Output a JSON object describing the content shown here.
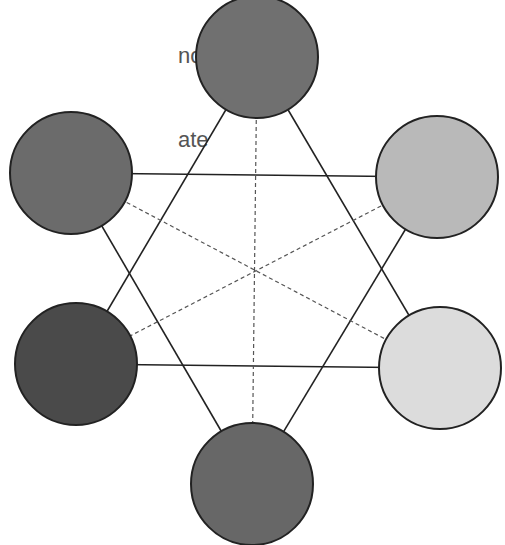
{
  "caption": {
    "line1": "                              notice",
    "line2": "ate",
    "line3": "i"
  },
  "diagram": {
    "nodes": [
      {
        "id": "top",
        "cx": 257,
        "cy": 57,
        "r": 61,
        "fill": "#707070"
      },
      {
        "id": "upper-right",
        "cx": 437,
        "cy": 177,
        "r": 61,
        "fill": "#b9b9b9"
      },
      {
        "id": "lower-right",
        "cx": 440,
        "cy": 368,
        "r": 61,
        "fill": "#dcdcdc"
      },
      {
        "id": "bottom",
        "cx": 252,
        "cy": 484,
        "r": 61,
        "fill": "#676767"
      },
      {
        "id": "lower-left",
        "cx": 76,
        "cy": 364,
        "r": 61,
        "fill": "#4a4a4a"
      },
      {
        "id": "upper-left",
        "cx": 71,
        "cy": 173,
        "r": 61,
        "fill": "#6b6b6b"
      }
    ],
    "solid_edges": [
      [
        "top",
        "lower-left"
      ],
      [
        "top",
        "lower-right"
      ],
      [
        "lower-left",
        "lower-right"
      ],
      [
        "upper-left",
        "upper-right"
      ],
      [
        "upper-left",
        "bottom"
      ],
      [
        "upper-right",
        "bottom"
      ]
    ],
    "dashed_edges": [
      [
        "top",
        "bottom"
      ],
      [
        "upper-left",
        "lower-right"
      ],
      [
        "upper-right",
        "lower-left"
      ]
    ],
    "stroke": "#222222"
  }
}
